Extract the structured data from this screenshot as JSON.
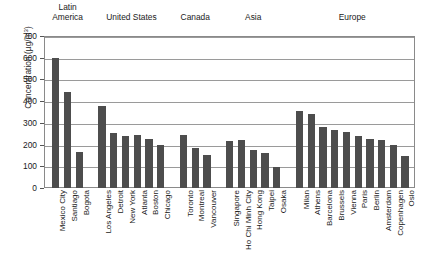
{
  "chart_data": {
    "type": "bar",
    "title": "",
    "xlabel": "",
    "ylabel": "Concentration (µg/m³)",
    "ylabel_main": "Concentration (µg/m",
    "ylabel_sup": "3",
    "ylabel_tail": ")",
    "ylim": [
      0,
      700
    ],
    "ytick_step": 100,
    "yticks": [
      "0",
      "100",
      "200",
      "300",
      "400",
      "500",
      "600",
      "700"
    ],
    "grid": "horizontal",
    "legend": "none",
    "bar_color": "#4d4d4d",
    "frame_color": "#8a8a8a",
    "gridline_color": "#9a9a9a",
    "categories": [
      "Mexico City",
      "Santiago",
      "Bogota",
      "Los Angeles",
      "Detroit",
      "New York",
      "Atlanta",
      "Boston",
      "Chicago",
      "Toronto",
      "Montreal",
      "Vancouver",
      "Singapore",
      "Ho Chi Minh City",
      "Hong Kong",
      "Taipei",
      "Osaka",
      "Milan",
      "Athens",
      "Barcelona",
      "Brussels",
      "Vienna",
      "Paris",
      "Berlin",
      "Amsterdam",
      "Copenhagen",
      "Oslo"
    ],
    "values": [
      600,
      440,
      165,
      380,
      255,
      240,
      243,
      228,
      197,
      242,
      185,
      150,
      218,
      222,
      175,
      160,
      95,
      355,
      340,
      280,
      268,
      258,
      238,
      228,
      220,
      197,
      148
    ],
    "groups": [
      {
        "label": "Latin\nAmerica",
        "cities": [
          "Mexico City",
          "Santiago",
          "Bogota"
        ]
      },
      {
        "label": "United States",
        "cities": [
          "Los Angeles",
          "Detroit",
          "New York",
          "Atlanta",
          "Boston",
          "Chicago"
        ]
      },
      {
        "label": "Canada",
        "cities": [
          "Toronto",
          "Montreal",
          "Vancouver"
        ]
      },
      {
        "label": "Asia",
        "cities": [
          "Singapore",
          "Ho Chi Minh City",
          "Hong Kong",
          "Taipei",
          "Osaka"
        ]
      },
      {
        "label": "Europe",
        "cities": [
          "Milan",
          "Athens",
          "Barcelona",
          "Brussels",
          "Vienna",
          "Paris",
          "Berlin",
          "Amsterdam",
          "Copenhagen",
          "Oslo"
        ]
      }
    ]
  }
}
